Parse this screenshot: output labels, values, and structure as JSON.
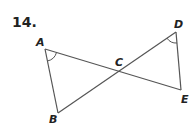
{
  "problem": {
    "number": "14."
  },
  "figure": {
    "labels": {
      "A": "A",
      "B": "B",
      "C": "C",
      "D": "D",
      "E": "E"
    },
    "segments": [
      "AE",
      "BD",
      "AB",
      "DE"
    ],
    "intersection": "C",
    "marked_angles": [
      "A",
      "D"
    ],
    "colors": {
      "line": "#555555",
      "text": "#222222"
    }
  }
}
